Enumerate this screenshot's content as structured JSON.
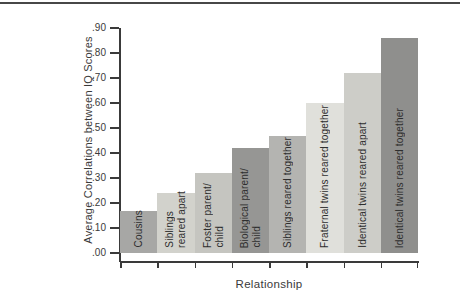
{
  "figure": {
    "background": "#ffffff",
    "top_rule_color": "#474747",
    "axis_color": "#3a3a3a",
    "label_text_color": "#2e2e2e"
  },
  "chart_data": {
    "type": "bar",
    "title": "",
    "xlabel": "Relationship",
    "ylabel": "Average Correlations between IQ Scores",
    "ylim": [
      0.0,
      0.9
    ],
    "ytick_labels": [
      ".00",
      ".10",
      ".20",
      ".30",
      ".40",
      ".50",
      ".60",
      ".70",
      ".80",
      ".90"
    ],
    "grid": false,
    "legend": "none",
    "categories": [
      "Cousins",
      "Siblings reared apart",
      "Foster parent/child",
      "Biological parent/child",
      "Siblings reared together",
      "Fraternal twins reared together",
      "Identical twins reared apart",
      "Identical twins reared together"
    ],
    "values": [
      0.17,
      0.24,
      0.32,
      0.42,
      0.47,
      0.6,
      0.72,
      0.86
    ],
    "bars": [
      {
        "lines": [
          "Cousins"
        ],
        "value": 0.17,
        "color": "#a7a7a5"
      },
      {
        "lines": [
          "Siblings",
          "reared apart"
        ],
        "value": 0.24,
        "color": "#d2d2cc"
      },
      {
        "lines": [
          "Foster parent/",
          "child"
        ],
        "value": 0.32,
        "color": "#c5c5c0"
      },
      {
        "lines": [
          "Biological parent/",
          "child"
        ],
        "value": 0.42,
        "color": "#969694"
      },
      {
        "lines": [
          "Siblings reared together"
        ],
        "value": 0.47,
        "color": "#b4b4b1"
      },
      {
        "lines": [
          "Fraternal twins reared together"
        ],
        "value": 0.6,
        "color": "#e0e0db"
      },
      {
        "lines": [
          "Identical twins reared apart"
        ],
        "value": 0.72,
        "color": "#cdcdc8"
      },
      {
        "lines": [
          "Identical twins reared together"
        ],
        "value": 0.86,
        "color": "#8f8f8d"
      }
    ]
  }
}
